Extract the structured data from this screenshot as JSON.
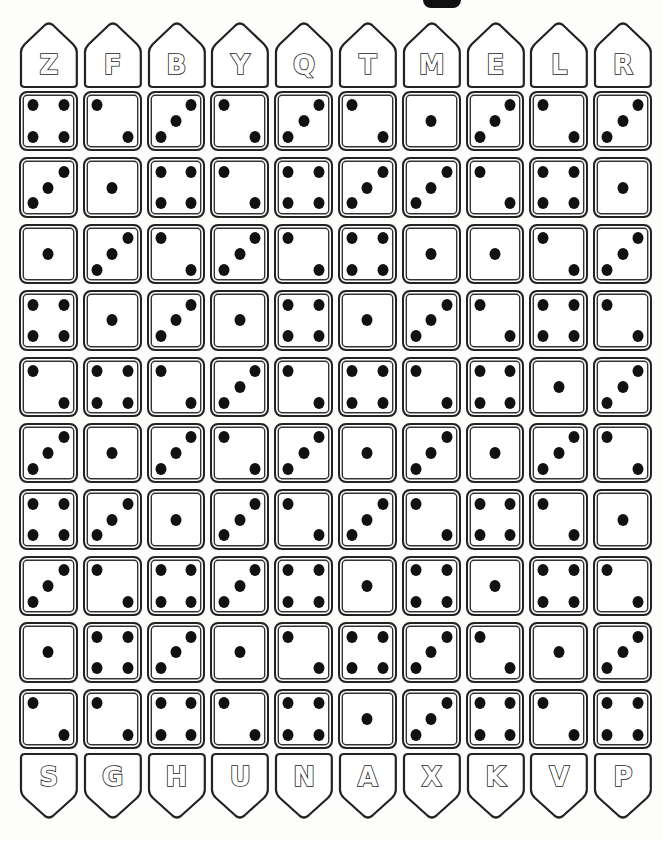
{
  "puzzle": {
    "top_letters": [
      "Z",
      "F",
      "B",
      "Y",
      "Q",
      "T",
      "M",
      "E",
      "L",
      "R"
    ],
    "bottom_letters": [
      "S",
      "G",
      "H",
      "U",
      "N",
      "A",
      "X",
      "K",
      "V",
      "P"
    ],
    "dice_rows": [
      [
        4,
        2,
        3,
        2,
        3,
        2,
        1,
        3,
        2,
        3
      ],
      [
        3,
        1,
        4,
        2,
        4,
        3,
        3,
        2,
        4,
        1
      ],
      [
        1,
        3,
        2,
        3,
        2,
        4,
        1,
        1,
        2,
        3
      ],
      [
        4,
        1,
        3,
        1,
        4,
        1,
        3,
        2,
        4,
        2
      ],
      [
        2,
        4,
        2,
        3,
        2,
        4,
        2,
        4,
        1,
        3
      ],
      [
        3,
        1,
        3,
        2,
        3,
        1,
        3,
        1,
        3,
        2
      ],
      [
        4,
        3,
        1,
        3,
        2,
        3,
        2,
        4,
        2,
        1
      ],
      [
        3,
        2,
        4,
        3,
        4,
        1,
        4,
        1,
        4,
        2
      ],
      [
        1,
        4,
        3,
        1,
        2,
        4,
        3,
        2,
        1,
        3
      ],
      [
        2,
        2,
        4,
        2,
        4,
        1,
        3,
        4,
        2,
        4
      ]
    ],
    "colors": {
      "ink": "#111111",
      "paper": "#fdfdfb"
    }
  }
}
